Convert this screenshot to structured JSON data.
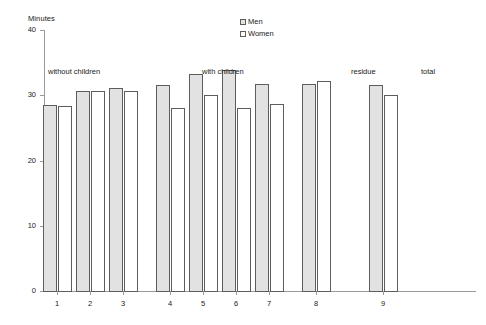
{
  "chart_data": {
    "type": "bar",
    "title": "",
    "subtitle": "",
    "xlabel": "",
    "ylabel": "Minutes",
    "ylim": [
      0,
      40
    ],
    "yticks": [
      0,
      10,
      20,
      30,
      40
    ],
    "ytick_labels": [
      "0",
      "10",
      "20",
      "30",
      "40"
    ],
    "grid": false,
    "legend_position": "top-center",
    "categories": [
      "1",
      "2",
      "3",
      "4",
      "5",
      "6",
      "7",
      "8",
      "9"
    ],
    "series": [
      {
        "name": "Men",
        "color": "#e2e2e2",
        "values": [
          28.5,
          30.6,
          31.1,
          31.6,
          33.2,
          33.8,
          31.8,
          31.8,
          31.5
        ]
      },
      {
        "name": "Women",
        "color": "#ffffff",
        "values": [
          28.3,
          30.6,
          30.7,
          28.1,
          30.0,
          28.0,
          28.6,
          32.2,
          30.0
        ]
      }
    ],
    "annotations": [
      {
        "text": "without children",
        "x_left_px": 48,
        "y_px": 67
      },
      {
        "text": "with children",
        "x_left_px": 202,
        "y_px": 67
      },
      {
        "text": "residue",
        "x_left_px": 351,
        "y_px": 67
      },
      {
        "text": "total",
        "x_left_px": 421,
        "y_px": 67
      }
    ]
  },
  "axis": {
    "y_title": "Minutes"
  },
  "legend": {
    "entries": [
      {
        "label": "Men",
        "swatch": "men-swatch"
      },
      {
        "label": "Women",
        "swatch": "women-swatch"
      }
    ]
  }
}
